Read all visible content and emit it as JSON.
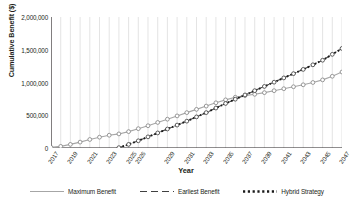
{
  "chart_data": {
    "type": "line",
    "title": "",
    "xlabel": "Year",
    "ylabel": "Cumulative Benefit ($)",
    "xlim": [
      2017,
      2047
    ],
    "ylim": [
      0,
      2000000
    ],
    "ytick_values": [
      0,
      500000,
      1000000,
      1500000,
      2000000
    ],
    "ytick_labels": [
      "0",
      "500,000",
      "1,000,000",
      "1,500,000",
      "2,000,000"
    ],
    "x": [
      2017,
      2018,
      2019,
      2020,
      2021,
      2022,
      2023,
      2024,
      2025,
      2026,
      2027,
      2028,
      2029,
      2030,
      2031,
      2032,
      2033,
      2034,
      2035,
      2036,
      2037,
      2038,
      2039,
      2040,
      2041,
      2042,
      2043,
      2044,
      2045,
      2046,
      2047
    ],
    "xtick_values": [
      2017,
      2019,
      2021,
      2023,
      2025,
      2026,
      2029,
      2031,
      2033,
      2035,
      2037,
      2039,
      2041,
      2043,
      2045,
      2047
    ],
    "xtick_labels": [
      "2017",
      "2019",
      "2021",
      "2023",
      "2025",
      "2026",
      "2029",
      "2031",
      "2033",
      "2035",
      "2037",
      "2039",
      "2041",
      "2043",
      "2045",
      "2047"
    ],
    "grid": "vertical",
    "legend_position": "bottom",
    "marker": "open-circle",
    "series": [
      {
        "name": "Maximum Benefit",
        "color": "#a6a6a6",
        "style": "solid",
        "x": [
          2017,
          2018,
          2019,
          2020,
          2021,
          2022,
          2023,
          2024,
          2025,
          2026,
          2027,
          2028,
          2029,
          2030,
          2031,
          2032,
          2033,
          2034,
          2035,
          2036,
          2037,
          2038,
          2039,
          2040,
          2041,
          2042,
          2043,
          2044,
          2045,
          2046,
          2047
        ],
        "values": [
          10000,
          25000,
          55000,
          90000,
          130000,
          165000,
          195000,
          215000,
          250000,
          295000,
          340000,
          390000,
          440000,
          490000,
          540000,
          590000,
          640000,
          690000,
          735000,
          775000,
          800000,
          820000,
          845000,
          875000,
          905000,
          935000,
          965000,
          1000000,
          1040000,
          1095000,
          1160000
        ]
      },
      {
        "name": "Earliest Benefit",
        "color": "#404040",
        "style": "dashed",
        "x": [
          2024,
          2025,
          2026,
          2027,
          2028,
          2029,
          2030,
          2031,
          2032,
          2033,
          2034,
          2035,
          2036,
          2037,
          2038,
          2039,
          2040,
          2041,
          2042,
          2043,
          2044,
          2045,
          2046,
          2047
        ],
        "values": [
          5000,
          55000,
          110000,
          170000,
          230000,
          290000,
          350000,
          410000,
          475000,
          540000,
          610000,
          680000,
          745000,
          810000,
          875000,
          940000,
          1005000,
          1070000,
          1135000,
          1200000,
          1270000,
          1340000,
          1430000,
          1520000
        ]
      },
      {
        "name": "Hybrid Strategy",
        "color": "#1a1a1a",
        "style": "dotted",
        "x": [
          2024,
          2025,
          2026,
          2027,
          2028,
          2029,
          2030,
          2031,
          2032,
          2033,
          2034,
          2035,
          2036,
          2037,
          2038,
          2039,
          2040,
          2041,
          2042,
          2043,
          2044,
          2045,
          2046,
          2047
        ],
        "values": [
          5000,
          55000,
          110000,
          170000,
          230000,
          290000,
          350000,
          410000,
          475000,
          540000,
          610000,
          680000,
          745000,
          810000,
          875000,
          940000,
          1005000,
          1070000,
          1135000,
          1200000,
          1270000,
          1340000,
          1430000,
          1520000
        ]
      }
    ]
  },
  "legend": {
    "items": [
      {
        "label": "Maximum Benefit",
        "style": "solid",
        "color": "#a6a6a6"
      },
      {
        "label": "Earliest Benefit",
        "style": "dashed",
        "color": "#404040"
      },
      {
        "label": "Hybrid Strategy",
        "style": "dotted",
        "color": "#1a1a1a"
      }
    ]
  }
}
